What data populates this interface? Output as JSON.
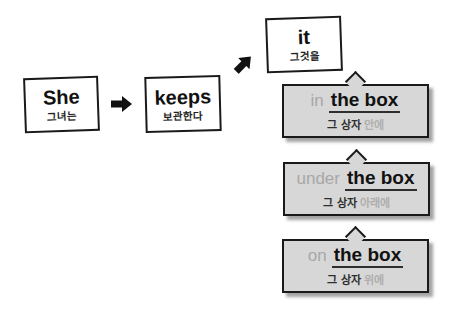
{
  "diagram": {
    "subject": {
      "en": "She",
      "ko": "그녀는"
    },
    "verb": {
      "en": "keeps",
      "ko": "보관한다"
    },
    "object": {
      "en": "it",
      "ko": "그것을"
    },
    "options": [
      {
        "prep_en": "in",
        "rest_en": "the box",
        "ko_main": "그 상자",
        "ko_prep": "안에"
      },
      {
        "prep_en": "under",
        "rest_en": "the box",
        "ko_main": "그 상자",
        "ko_prep": "아래에"
      },
      {
        "prep_en": "on",
        "rest_en": "the box",
        "ko_main": "그 상자",
        "ko_prep": "위에"
      }
    ],
    "icons": {
      "between_subject_verb": "right-arrow-icon",
      "between_verb_object": "up-right-arrow-icon"
    },
    "colors": {
      "box_border": "#1a1a1a",
      "bubble_fill": "#d7d7d7",
      "bubble_shadow": "#a3a3a3",
      "muted_text": "#a7a7a7",
      "dark_text": "#111111"
    }
  }
}
